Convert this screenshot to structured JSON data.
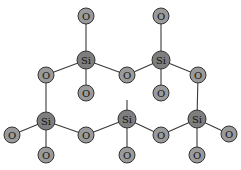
{
  "diagram": {
    "title": "",
    "atoms": [
      {
        "id": "o1",
        "el": "O",
        "label": "O",
        "x": 86,
        "y": 16,
        "r": 8
      },
      {
        "id": "si1",
        "el": "Si",
        "label": "Si",
        "x": 86,
        "y": 60,
        "r": 9
      },
      {
        "id": "o2",
        "el": "O",
        "label": "O",
        "x": 46,
        "y": 75,
        "r": 8
      },
      {
        "id": "o3",
        "el": "O",
        "label": "O",
        "x": 86,
        "y": 93,
        "r": 8
      },
      {
        "id": "o4",
        "el": "O",
        "label": "O",
        "x": 127,
        "y": 75,
        "r": 8
      },
      {
        "id": "o5",
        "el": "O",
        "label": "O",
        "x": 161,
        "y": 16,
        "r": 8
      },
      {
        "id": "si2",
        "el": "Si",
        "label": "Si",
        "x": 161,
        "y": 60,
        "r": 9
      },
      {
        "id": "o6",
        "el": "O",
        "label": "O",
        "x": 161,
        "y": 93,
        "r": 8
      },
      {
        "id": "o7",
        "el": "O",
        "label": "O",
        "x": 198,
        "y": 75,
        "r": 8
      },
      {
        "id": "si3",
        "el": "Si",
        "label": "Si",
        "x": 46,
        "y": 121,
        "r": 9
      },
      {
        "id": "o8",
        "el": "O",
        "label": "O",
        "x": 12,
        "y": 135,
        "r": 8
      },
      {
        "id": "o9",
        "el": "O",
        "label": "O",
        "x": 46,
        "y": 155,
        "r": 8
      },
      {
        "id": "o10",
        "el": "O",
        "label": "O",
        "x": 86,
        "y": 135,
        "r": 8
      },
      {
        "id": "si4",
        "el": "Si",
        "label": "Si",
        "x": 127,
        "y": 119,
        "r": 9
      },
      {
        "id": "o11",
        "el": "O",
        "label": "O",
        "x": 127,
        "y": 155,
        "r": 8
      },
      {
        "id": "o12",
        "el": "O",
        "label": "O",
        "x": 161,
        "y": 135,
        "r": 8
      },
      {
        "id": "si5",
        "el": "Si",
        "label": "Si",
        "x": 197,
        "y": 119,
        "r": 9
      },
      {
        "id": "o13",
        "el": "O",
        "label": "O",
        "x": 229,
        "y": 134,
        "r": 8
      },
      {
        "id": "o14",
        "el": "O",
        "label": "O",
        "x": 197,
        "y": 155,
        "r": 8
      }
    ],
    "bonds": [
      [
        "o1",
        "si1"
      ],
      [
        "si1",
        "o2"
      ],
      [
        "si1",
        "o3"
      ],
      [
        "si1",
        "o4"
      ],
      [
        "o4",
        "si2"
      ],
      [
        "o5",
        "si2"
      ],
      [
        "si2",
        "o6"
      ],
      [
        "si2",
        "o7"
      ],
      [
        "o2",
        "si3"
      ],
      [
        "si3",
        "o8"
      ],
      [
        "si3",
        "o9"
      ],
      [
        "si3",
        "o10"
      ],
      [
        "o10",
        "si4"
      ],
      [
        "si4",
        "o11"
      ],
      [
        "si4",
        "o12"
      ],
      [
        "o12",
        "si5"
      ],
      [
        "o7",
        "si5"
      ],
      [
        "si5",
        "o13"
      ],
      [
        "si5",
        "o14"
      ]
    ],
    "stub_bonds": [
      {
        "from": "si4",
        "x2": 127,
        "y2": 100
      }
    ]
  }
}
